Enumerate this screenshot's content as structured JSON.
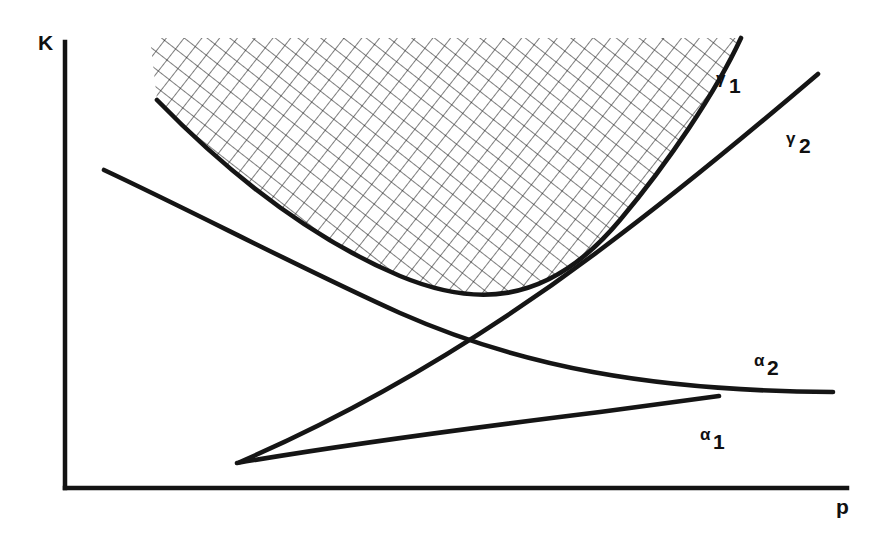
{
  "figure": {
    "title": "",
    "background_color": "#ffffff",
    "line_color": "#131313",
    "width": 882,
    "height": 541
  },
  "axes": {
    "y_label": "K",
    "x_label": "p",
    "origin": {
      "x": 65,
      "y": 488
    },
    "y_top": {
      "x": 65,
      "y": 42
    },
    "x_right": {
      "x": 847,
      "y": 488
    },
    "y_label_pos": {
      "x": 38,
      "y": 50
    },
    "x_label_pos": {
      "x": 836,
      "y": 514
    }
  },
  "curves": [
    {
      "id": "alpha1",
      "label_base": "α",
      "label_sub": "1",
      "direction": "decreasing",
      "label_pos": {
        "x": 700,
        "y": 440
      },
      "path": "M 237,463 C 330,447 470,428 600,412 C 660,404 695,399 719,396",
      "start": {
        "x": 237,
        "y": 463
      },
      "end": {
        "x": 719,
        "y": 396
      }
    },
    {
      "id": "alpha2",
      "label_base": "α",
      "label_sub": "2",
      "direction": "decreasing",
      "label_pos": {
        "x": 754,
        "y": 366
      },
      "path": "M 104,170 C 200,215 300,268 400,313 C 520,366 650,391 833,392",
      "start": {
        "x": 104,
        "y": 170
      },
      "end": {
        "x": 833,
        "y": 392
      }
    },
    {
      "id": "gamma1",
      "label_base": "γ",
      "label_sub": "1",
      "direction": "increasing-convex",
      "label_pos": {
        "x": 716,
        "y": 84
      },
      "path": "M 157,100 C 230,175 310,238 400,276 C 470,305 545,310 620,220 C 668,163 716,92 741,38",
      "start": {
        "x": 157,
        "y": 100
      },
      "end": {
        "x": 741,
        "y": 38
      }
    },
    {
      "id": "gamma2",
      "label_base": "γ",
      "label_sub": "2",
      "direction": "increasing",
      "label_pos": {
        "x": 786,
        "y": 144
      },
      "path": "M 240,462 C 360,410 480,340 600,250 C 690,183 770,115 818,74",
      "start": {
        "x": 240,
        "y": 462
      },
      "end": {
        "x": 818,
        "y": 74
      }
    }
  ],
  "hatched_region": {
    "id": "feasible-region",
    "description": "cross-hatched area above the gamma-1 curve",
    "pattern": "cross-hatch",
    "cell_size_px": 14,
    "rotation_deg": 38,
    "stroke_color": "#1d1d1d",
    "top_edge_y": 38,
    "left_edge_x": 150,
    "right_edge_x": 745
  },
  "intersections": [
    {
      "id": "alpha2-gamma1",
      "x": 423,
      "y": 281
    },
    {
      "id": "alpha2-gamma2",
      "x": 337,
      "y": 331
    },
    {
      "id": "alpha1-gamma2",
      "x": 438,
      "y": 385
    },
    {
      "id": "alpha1-gamma1",
      "x": 563,
      "y": 328
    }
  ]
}
